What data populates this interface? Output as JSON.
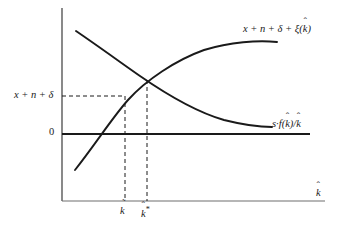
{
  "figure": {
    "type": "economics-diagram",
    "background_color": "#ffffff",
    "line_color": "#1a1a1a"
  },
  "axes": {
    "x_axis_label": "k",
    "x_axis_label_accent": "hat",
    "y_axis_value_label": "x + n + δ",
    "origin_label": "0",
    "x_ticks": [
      {
        "name": "k-tilde",
        "label": "k",
        "accent": "tilde",
        "superscript": "",
        "x_px": 125
      },
      {
        "name": "k-star",
        "label": "k",
        "accent": "hat",
        "superscript": "*",
        "x_px": 147
      }
    ],
    "vertical_axis_x_px": 62,
    "zero_line_y_px": 134,
    "bottom_axis_y_px": 201
  },
  "curves": [
    {
      "name": "effective-depreciation-curve",
      "label": "x + n + δ + ξ(k)",
      "label_parts": {
        "prefix": "x + n + δ + ξ(",
        "var": "k",
        "accent": "hat",
        "suffix": ")"
      },
      "shape": "increasing-concave",
      "path": "M 75,170 C 97,142 112,118 128,100 C 146,80 176,60 204,50 C 230,42 258,40 277,42",
      "label_position": {
        "x_px": 243,
        "y_px": 24
      }
    },
    {
      "name": "saving-curve",
      "label": "s·f(k)/k",
      "label_parts": {
        "prefix": "s·f(",
        "var": "k",
        "accent": "hat",
        "mid": ")/",
        "var2": "k",
        "accent2": "hat"
      },
      "shape": "decreasing-convex",
      "path": "M 76,31 C 98,46 120,62 140,76 C 166,94 196,112 224,120 C 244,125 262,127 272,127",
      "label_position": {
        "x_px": 272,
        "y_px": 119
      }
    }
  ],
  "guides": {
    "intersection_point": {
      "x_px": 146,
      "y_px": 80
    },
    "dashed_horizontal": {
      "from_x_px": 62,
      "to_x_px": 125,
      "y_px": 96
    },
    "dashed_vertical_ktilde": {
      "x_px": 125,
      "from_y_px": 96,
      "to_y_px": 201
    },
    "dashed_vertical_kstar": {
      "x_px": 147,
      "from_y_px": 80,
      "to_y_px": 201
    }
  },
  "labels": {
    "growth_curve_prefix": "x + n + δ + ξ(",
    "growth_curve_suffix": ")",
    "saving_prefix": "s·f(",
    "saving_mid": ")/",
    "yaxis_value": "x + n + δ",
    "origin": "0",
    "var_k": "k",
    "star": "*"
  }
}
